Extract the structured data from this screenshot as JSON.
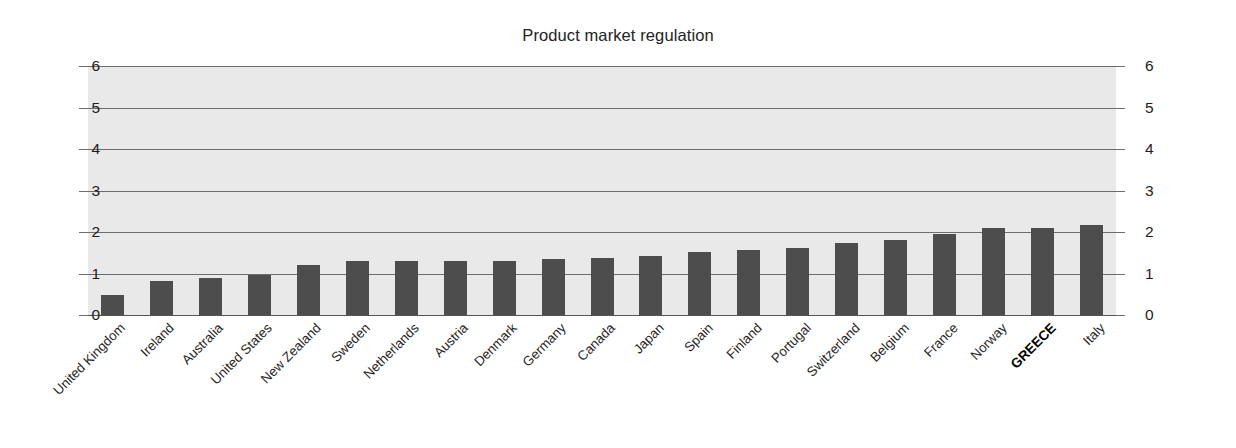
{
  "chart_data": {
    "type": "bar",
    "title": "Product market regulation",
    "xlabel": "",
    "ylabel": "",
    "ylim": [
      0,
      6
    ],
    "yticks": [
      0,
      1,
      2,
      3,
      4,
      5,
      6
    ],
    "grid": true,
    "legend": false,
    "dual_y_axis": true,
    "categories": [
      "United Kingdom",
      "Ireland",
      "Australia",
      "United States",
      "New Zealand",
      "Sweden",
      "Netherlands",
      "Austria",
      "Denmark",
      "Germany",
      "Canada",
      "Japan",
      "Spain",
      "Finland",
      "Portugal",
      "Switzerland",
      "Belgium",
      "France",
      "Norway",
      "GREECE",
      "Italy"
    ],
    "values": [
      0.48,
      0.83,
      0.89,
      0.96,
      1.21,
      1.29,
      1.29,
      1.3,
      1.31,
      1.34,
      1.37,
      1.42,
      1.51,
      1.57,
      1.62,
      1.73,
      1.81,
      1.95,
      2.09,
      2.1,
      2.16
    ],
    "highlight_category": "GREECE",
    "colors": {
      "bar_fill": "#4d4d4d",
      "plot_background": "#e9e9e9",
      "gridline": "#6d6d6d",
      "text": "#1f1f1f",
      "page_background": "#ffffff"
    }
  }
}
